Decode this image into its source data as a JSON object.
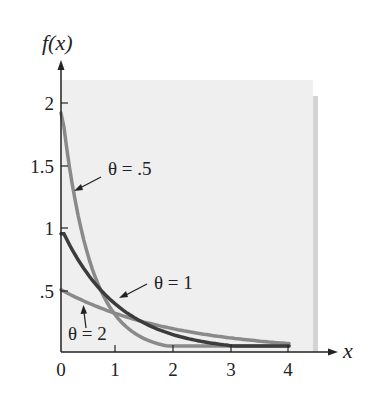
{
  "chart_data": {
    "type": "line",
    "title": "",
    "xlabel": "x",
    "ylabel": "f(x)",
    "xlim": [
      0,
      4.5
    ],
    "ylim": [
      0,
      2.2
    ],
    "xticks": [
      "0",
      "1",
      "2",
      "3",
      "4"
    ],
    "yticks": [
      ".5",
      "1",
      "1.5",
      "2"
    ],
    "grid": false,
    "series": [
      {
        "name": "θ = .5",
        "function": "f(x) = (1/θ) e^(-x/θ)",
        "theta": 0.5,
        "x": [
          0,
          0.5,
          1,
          1.5,
          2,
          3,
          4
        ],
        "values": [
          2.0,
          0.74,
          0.27,
          0.1,
          0.04,
          0.005,
          0.0007
        ],
        "color": "#8a8a8a"
      },
      {
        "name": "θ = 1",
        "function": "f(x) = (1/θ) e^(-x/θ)",
        "theta": 1,
        "x": [
          0,
          0.5,
          1,
          1.5,
          2,
          3,
          4
        ],
        "values": [
          1.0,
          0.61,
          0.37,
          0.22,
          0.14,
          0.05,
          0.02
        ],
        "color": "#3c3c3c"
      },
      {
        "name": "θ = 2",
        "function": "f(x) = (1/θ) e^(-x/θ)",
        "theta": 2,
        "x": [
          0,
          0.5,
          1,
          1.5,
          2,
          3,
          4
        ],
        "values": [
          0.5,
          0.39,
          0.3,
          0.24,
          0.18,
          0.11,
          0.07
        ],
        "color": "#8a8a8a"
      }
    ],
    "annotations": [
      {
        "text": "θ = .5",
        "points_to": "θ = .5 curve"
      },
      {
        "text": "θ = 1",
        "points_to": "θ = 1 curve"
      },
      {
        "text": "θ = 2",
        "points_to": "θ = 2 curve"
      }
    ]
  },
  "labels": {
    "ylabel": "f(x)",
    "xlabel": "x",
    "xticks": [
      "0",
      "1",
      "2",
      "3",
      "4"
    ],
    "yticks": [
      ".5",
      "1",
      "1.5",
      "2"
    ],
    "ann_half": "θ = .5",
    "ann_one": "θ = 1",
    "ann_two": "θ = 2"
  }
}
